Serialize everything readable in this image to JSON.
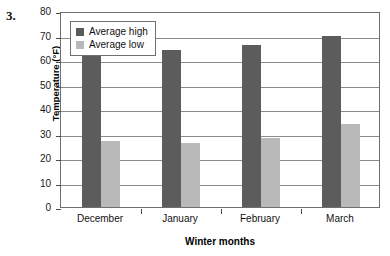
{
  "problem": {
    "number": "3."
  },
  "chart_data": {
    "type": "bar",
    "title": "",
    "xlabel": "Winter months",
    "ylabel": "Temperature (°F)",
    "categories": [
      "December",
      "January",
      "February",
      "March"
    ],
    "series": [
      {
        "name": "Average high",
        "values": [
          64,
          64,
          66,
          70
        ],
        "color": "#5c5c5c"
      },
      {
        "name": "Average low",
        "values": [
          27,
          26,
          28,
          34
        ],
        "color": "#b9b9b9"
      }
    ],
    "ylim": [
      0,
      80
    ],
    "ytick_step": 10,
    "yticks": [
      0,
      10,
      20,
      30,
      40,
      50,
      60,
      70,
      80
    ],
    "ytick_labels": [
      "0",
      "10",
      "20",
      "30",
      "40",
      "50",
      "60",
      "70",
      "80"
    ],
    "grid": true,
    "grid_axis": "y",
    "legend_position": "upper left",
    "legend_entries": [
      "Average high",
      "Average low"
    ]
  }
}
